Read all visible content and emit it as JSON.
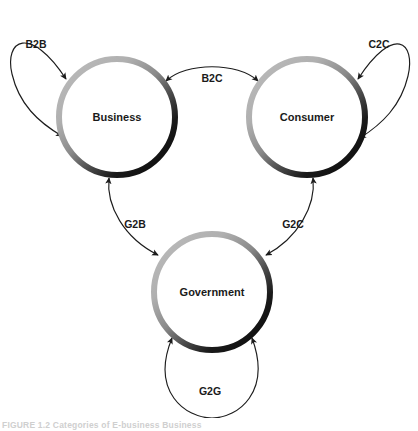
{
  "figure": {
    "caption": "FIGURE 1.2   Categories of E-business Business",
    "background_color": "#ffffff",
    "ink_color": "#1c1c1c"
  },
  "diagram": {
    "type": "relationship-diagram",
    "ring_gradient": {
      "light_color": "#b3b3b3",
      "mid_color": "#6e6e6e",
      "dark_color": "#121212"
    },
    "nodes": [
      {
        "id": "business",
        "label": "Business",
        "cx": 117,
        "cy": 117,
        "r": 58
      },
      {
        "id": "consumer",
        "label": "Consumer",
        "cx": 307,
        "cy": 117,
        "r": 58
      },
      {
        "id": "government",
        "label": "Government",
        "cx": 212,
        "cy": 292,
        "r": 58
      }
    ],
    "edges": [
      {
        "id": "b2b",
        "label": "B2B",
        "kind": "self-loop",
        "from": "business",
        "to": "business",
        "label_x": 36,
        "label_y": 45,
        "arrowheads": "both"
      },
      {
        "id": "c2c",
        "label": "C2C",
        "kind": "self-loop",
        "from": "consumer",
        "to": "consumer",
        "label_x": 379,
        "label_y": 45,
        "arrowheads": "both"
      },
      {
        "id": "g2g",
        "label": "G2G",
        "kind": "self-loop",
        "from": "government",
        "to": "government",
        "label_x": 210,
        "label_y": 392,
        "arrowheads": "both"
      },
      {
        "id": "b2c",
        "label": "B2C",
        "kind": "bidirectional",
        "from": "business",
        "to": "consumer",
        "label_x": 212,
        "label_y": 80,
        "arrowheads": "both"
      },
      {
        "id": "g2b",
        "label": "G2B",
        "kind": "bidirectional",
        "from": "government",
        "to": "business",
        "label_x": 135,
        "label_y": 225,
        "arrowheads": "both"
      },
      {
        "id": "g2c",
        "label": "G2C",
        "kind": "bidirectional",
        "from": "government",
        "to": "consumer",
        "label_x": 293,
        "label_y": 225,
        "arrowheads": "both"
      }
    ]
  }
}
